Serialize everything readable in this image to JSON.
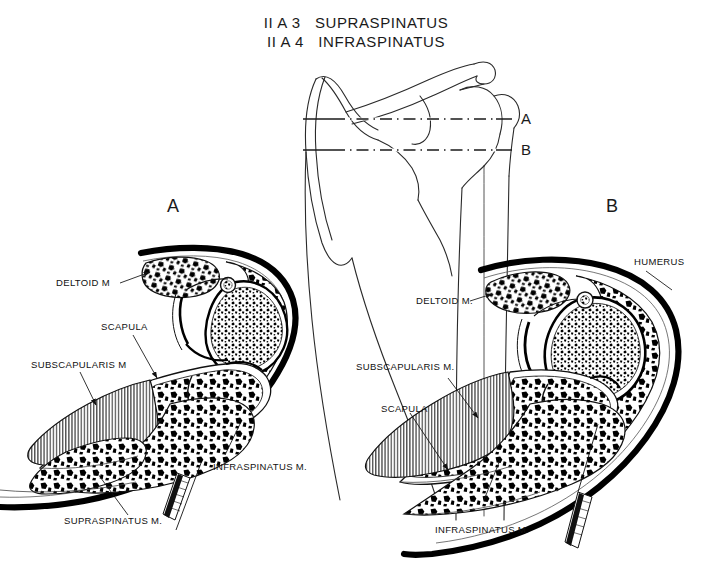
{
  "figure": {
    "title_line1": "II A 3   SUPRASPINATUS",
    "title_line2": "II A 4   INFRASPINATUS",
    "type": "anatomical-cross-section-diagram",
    "background_color": "#ffffff",
    "ink_color": "#111111"
  },
  "orientation_diagram": {
    "name": "scapula-humerus-anterior-view",
    "level_lines": [
      {
        "id": "A",
        "label": "A",
        "style": "dash-dot"
      },
      {
        "id": "B",
        "label": "B",
        "style": "dash-dot"
      }
    ]
  },
  "panels": [
    {
      "id": "A",
      "letter": "A",
      "section_level": "A",
      "labels": [
        {
          "name": "deltoid",
          "text": "DELTOID M"
        },
        {
          "name": "scapula",
          "text": "SCAPULA"
        },
        {
          "name": "subscapularis",
          "text": "SUBSCAPULARIS M"
        },
        {
          "name": "infraspinatus",
          "text": "INFRASPINATUS M."
        },
        {
          "name": "supraspinatus",
          "text": "SUPRASPINATUS  M."
        }
      ],
      "needle_markers": 1
    },
    {
      "id": "B",
      "letter": "B",
      "section_level": "B",
      "labels": [
        {
          "name": "humerus",
          "text": "HUMERUS"
        },
        {
          "name": "deltoid",
          "text": "DELTOID M."
        },
        {
          "name": "subscapularis",
          "text": "SUBSCAPULARIS  M."
        },
        {
          "name": "scapula",
          "text": "SCAPULA"
        },
        {
          "name": "infraspinatus",
          "text": "INFRASPINATUS M."
        }
      ],
      "needle_markers": 1
    }
  ]
}
